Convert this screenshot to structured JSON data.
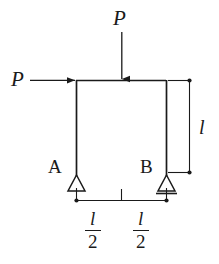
{
  "figure": {
    "width": 219,
    "height": 264,
    "background_color": "#ffffff",
    "line_color": "#1a1a1a"
  },
  "loads": {
    "vertical": {
      "label": "P",
      "direction": "down",
      "applied_at": "midspan-of-top-beam"
    },
    "horizontal": {
      "label": "P",
      "direction": "right",
      "applied_at": "top-left-joint"
    }
  },
  "supports": {
    "left": {
      "label": "A",
      "type": "pin"
    },
    "right": {
      "label": "B",
      "type": "roller"
    }
  },
  "dimensions": {
    "height": {
      "label": "l"
    },
    "span_left": {
      "numerator": "l",
      "denominator": "2"
    },
    "span_right": {
      "numerator": "l",
      "denominator": "2"
    }
  },
  "icons": {
    "arrow_down": "arrow-down-icon",
    "arrow_right": "arrow-right-icon",
    "pin_support": "pin-support-triangle-icon",
    "roller_support": "roller-support-triangle-icon"
  }
}
